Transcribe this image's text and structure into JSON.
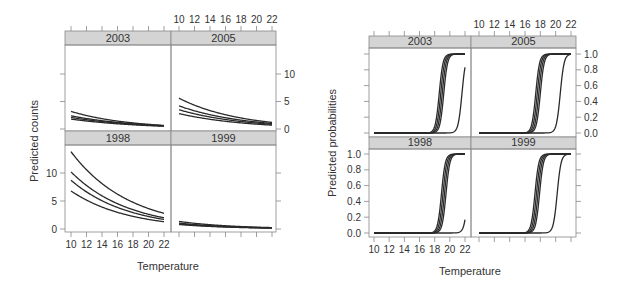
{
  "chart_data": [
    {
      "type": "line",
      "layout": "lattice 2x2",
      "title": "",
      "xlabel": "Temperature",
      "ylabel": "Predicted counts",
      "xlim": [
        9.2,
        22.8
      ],
      "ylim": [
        -0.5,
        15
      ],
      "xticks": [
        10,
        12,
        14,
        16,
        18,
        20,
        22
      ],
      "yticks": [
        0,
        5,
        10
      ],
      "grid": false,
      "legend": null,
      "model": "exponential decay: y = a * exp(-b*(x-10))",
      "panels": [
        {
          "label": "2003",
          "row": 0,
          "col": 0,
          "series": [
            {
              "start": 3.2,
              "end": 0.65
            },
            {
              "start": 2.4,
              "end": 0.6
            },
            {
              "start": 2.1,
              "end": 0.55
            },
            {
              "start": 1.8,
              "end": 0.5
            }
          ]
        },
        {
          "label": "2005",
          "row": 0,
          "col": 1,
          "series": [
            {
              "start": 5.6,
              "end": 1.2
            },
            {
              "start": 4.2,
              "end": 1.0
            },
            {
              "start": 3.5,
              "end": 0.85
            },
            {
              "start": 2.8,
              "end": 0.7
            }
          ]
        },
        {
          "label": "1998",
          "row": 1,
          "col": 0,
          "series": [
            {
              "start": 13.8,
              "end": 2.8
            },
            {
              "start": 10.2,
              "end": 2.0
            },
            {
              "start": 8.7,
              "end": 1.7
            },
            {
              "start": 6.8,
              "end": 1.3
            }
          ]
        },
        {
          "label": "1999",
          "row": 1,
          "col": 1,
          "series": [
            {
              "start": 1.35,
              "end": 0.25
            },
            {
              "start": 1.05,
              "end": 0.2
            },
            {
              "start": 0.9,
              "end": 0.18
            },
            {
              "start": 0.8,
              "end": 0.15
            }
          ]
        }
      ]
    },
    {
      "type": "line",
      "layout": "lattice 2x2",
      "title": "",
      "xlabel": "Temperature",
      "ylabel": "Predicted probabilities",
      "xlim": [
        9.2,
        22.8
      ],
      "ylim": [
        -0.05,
        1.1
      ],
      "xticks": [
        10,
        12,
        14,
        16,
        18,
        20,
        22
      ],
      "yticks": [
        0.0,
        0.2,
        0.4,
        0.6,
        0.8,
        1.0
      ],
      "grid": false,
      "legend": null,
      "model": "logistic: y = 1/(1+exp(-k*(x-x0)))",
      "panels": [
        {
          "label": "2003",
          "row": 0,
          "col": 0,
          "series": [
            {
              "x0": 18.6,
              "k": 4.0
            },
            {
              "x0": 18.8,
              "k": 4.0
            },
            {
              "x0": 19.0,
              "k": 4.0
            },
            {
              "x0": 19.2,
              "k": 4.0
            },
            {
              "x0": 21.6,
              "k": 4.0
            }
          ]
        },
        {
          "label": "2005",
          "row": 0,
          "col": 1,
          "series": [
            {
              "x0": 17.4,
              "k": 4.0
            },
            {
              "x0": 17.6,
              "k": 4.0
            },
            {
              "x0": 17.8,
              "k": 4.0
            },
            {
              "x0": 18.0,
              "k": 4.0
            },
            {
              "x0": 20.6,
              "k": 4.0
            }
          ]
        },
        {
          "label": "1998",
          "row": 1,
          "col": 0,
          "series": [
            {
              "x0": 18.9,
              "k": 4.0
            },
            {
              "x0": 19.1,
              "k": 4.0
            },
            {
              "x0": 19.3,
              "k": 4.0
            },
            {
              "x0": 19.5,
              "k": 4.0
            },
            {
              "x0": 22.4,
              "k": 4.0
            }
          ]
        },
        {
          "label": "1999",
          "row": 1,
          "col": 1,
          "series": [
            {
              "x0": 17.3,
              "k": 4.0
            },
            {
              "x0": 17.5,
              "k": 4.0
            },
            {
              "x0": 17.7,
              "k": 4.0
            },
            {
              "x0": 17.9,
              "k": 4.0
            },
            {
              "x0": 20.2,
              "k": 4.0
            }
          ]
        }
      ]
    }
  ],
  "figures": {
    "left": {
      "ylabel": "Predicted counts",
      "xlabel": "Temperature",
      "strips": [
        "2003",
        "2005",
        "1998",
        "1999"
      ]
    },
    "right": {
      "ylabel": "Predicted probabilities",
      "xlabel": "Temperature",
      "strips": [
        "2003",
        "2005",
        "1998",
        "1999"
      ]
    }
  },
  "colors": {
    "strip_fill": "#d4d4d4",
    "frame": "#888888",
    "line": "#2a2a2a",
    "text": "#333333"
  }
}
